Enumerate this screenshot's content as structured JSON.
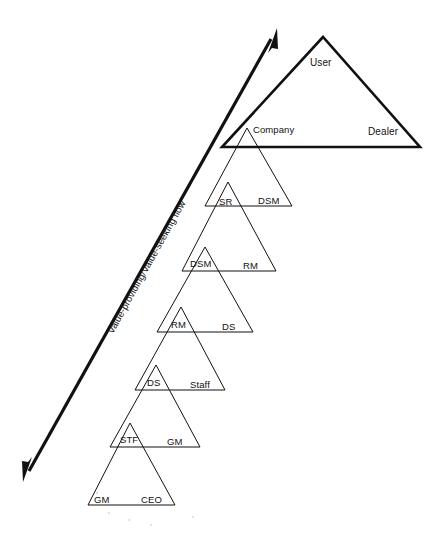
{
  "diagram": {
    "type": "nested-triangle-hierarchy",
    "canvas": {
      "width": 442,
      "height": 535
    },
    "stroke_color": "#111111",
    "background_color": "#ffffff",
    "flow_arrow": {
      "label": "Value-providing/Value-seeking flow",
      "direction": "double-headed",
      "from": {
        "x": 23,
        "y": 482
      },
      "to": {
        "x": 277,
        "y": 28
      },
      "label_rotation_deg": -61
    },
    "levels": [
      {
        "index": 0,
        "apex": {
          "x": 323,
          "y": 37
        },
        "base_left": {
          "x": 222,
          "y": 147
        },
        "base_right": {
          "x": 420,
          "y": 147
        },
        "emphasis": "heavy",
        "apex_label": "User",
        "apex_label_pos": {
          "x": 310,
          "y": 57
        },
        "right_label": "Dealer",
        "right_label_pos": {
          "x": 368,
          "y": 126
        }
      },
      {
        "index": 1,
        "apex": {
          "x": 247,
          "y": 128
        },
        "base_left": {
          "x": 205,
          "y": 206
        },
        "base_right": {
          "x": 292,
          "y": 206
        },
        "emphasis": "normal",
        "apex_label": "Company",
        "apex_label_pos": {
          "x": 253,
          "y": 124
        },
        "right_label": "DSM",
        "right_label_pos": {
          "x": 258,
          "y": 195
        }
      },
      {
        "index": 2,
        "apex": {
          "x": 228,
          "y": 182
        },
        "base_left": {
          "x": 182,
          "y": 271
        },
        "base_right": {
          "x": 276,
          "y": 271
        },
        "emphasis": "normal",
        "apex_label": "SR",
        "apex_label_pos": {
          "x": 219,
          "y": 196
        },
        "right_label": "RM",
        "right_label_pos": {
          "x": 243,
          "y": 260
        }
      },
      {
        "index": 3,
        "apex": {
          "x": 205,
          "y": 247
        },
        "base_left": {
          "x": 157,
          "y": 332
        },
        "base_right": {
          "x": 253,
          "y": 332
        },
        "emphasis": "normal",
        "apex_label": "DSM",
        "apex_label_pos": {
          "x": 190,
          "y": 258
        },
        "right_label": "DS",
        "right_label_pos": {
          "x": 222,
          "y": 321
        }
      },
      {
        "index": 4,
        "apex": {
          "x": 181,
          "y": 307
        },
        "base_left": {
          "x": 135,
          "y": 390
        },
        "base_right": {
          "x": 225,
          "y": 390
        },
        "emphasis": "normal",
        "apex_label": "RM",
        "apex_label_pos": {
          "x": 171,
          "y": 319
        },
        "right_label": "Staff",
        "right_label_pos": {
          "x": 190,
          "y": 379
        }
      },
      {
        "index": 5,
        "apex": {
          "x": 156,
          "y": 365
        },
        "base_left": {
          "x": 110,
          "y": 447
        },
        "base_right": {
          "x": 200,
          "y": 447
        },
        "emphasis": "normal",
        "apex_label": "DS",
        "apex_label_pos": {
          "x": 147,
          "y": 377
        },
        "right_label": "GM",
        "right_label_pos": {
          "x": 167,
          "y": 436
        }
      },
      {
        "index": 6,
        "apex": {
          "x": 130,
          "y": 423
        },
        "base_left": {
          "x": 88,
          "y": 505
        },
        "base_right": {
          "x": 175,
          "y": 505
        },
        "emphasis": "normal",
        "apex_label": "STF",
        "apex_label_pos": {
          "x": 120,
          "y": 434
        },
        "right_label": "CEO",
        "right_label_pos": {
          "x": 141,
          "y": 494
        }
      },
      {
        "index": 7,
        "apex": null,
        "base_left": null,
        "base_right": null,
        "emphasis": "none",
        "apex_label": "GM",
        "apex_label_pos": {
          "x": 94,
          "y": 494
        },
        "right_label": "",
        "right_label_pos": null
      }
    ],
    "label_sequence": [
      "User",
      "Dealer",
      "Company",
      "DSM",
      "SR",
      "RM",
      "DSM",
      "DS",
      "RM",
      "Staff",
      "DS",
      "GM",
      "STF",
      "CEO",
      "GM"
    ]
  }
}
